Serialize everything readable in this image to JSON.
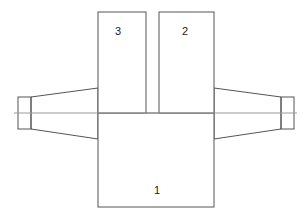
{
  "diagram": {
    "background_color": "#ffffff",
    "outline_color": "#555555",
    "centerline_color": "#999999",
    "label_color": "#1a1a1a",
    "stroke_width": 1,
    "labels": [
      {
        "id": "label-1",
        "text": "1",
        "x": 157,
        "y": 191,
        "part": "main-body"
      },
      {
        "id": "label-2",
        "text": "2",
        "x": 185,
        "y": 32,
        "part": "right-fin"
      },
      {
        "id": "label-3",
        "text": "3",
        "x": 118,
        "y": 32,
        "part": "left-fin"
      }
    ],
    "parts": {
      "main_body": {
        "name": "main-body",
        "shape": "rect",
        "x": 98,
        "y": 113,
        "width": 116,
        "height": 94
      },
      "left_fin": {
        "name": "left-fin",
        "shape": "rect",
        "x": 98,
        "y": 12,
        "width": 48,
        "height": 101
      },
      "right_fin": {
        "name": "right-fin",
        "shape": "rect",
        "x": 159,
        "y": 12,
        "width": 55,
        "height": 101
      },
      "left_taper": {
        "name": "left-taper",
        "shape": "polygon",
        "points": "31,97 98,88 98,139 31,129"
      },
      "right_taper": {
        "name": "right-taper",
        "shape": "polygon",
        "points": "214,88 281,97 281,129 214,139"
      },
      "left_bearing": {
        "name": "left-bearing-block",
        "shape": "rect",
        "x": 18,
        "y": 97,
        "width": 13,
        "height": 32
      },
      "right_bearing": {
        "name": "right-bearing-block",
        "shape": "rect",
        "x": 281,
        "y": 97,
        "width": 13,
        "height": 32
      },
      "centerline": {
        "name": "centerline",
        "shape": "line",
        "x1": 14,
        "y1": 113,
        "x2": 297,
        "y2": 113
      }
    }
  }
}
